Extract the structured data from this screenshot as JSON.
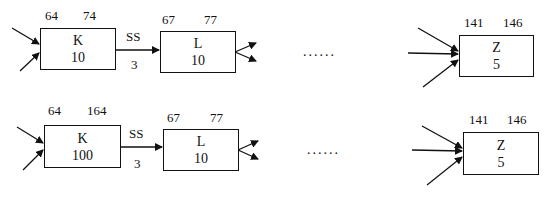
{
  "rows": [
    {
      "k": {
        "name": "K",
        "value": "10",
        "top_left": "64",
        "top_right": "74"
      },
      "edge": {
        "label_top": "SS",
        "label_bottom": "3"
      },
      "l": {
        "name": "L",
        "value": "10",
        "top_left": "67",
        "top_right": "77"
      },
      "ellipsis": "......",
      "z": {
        "name": "Z",
        "value": "5",
        "top_left": "141",
        "top_right": "146"
      }
    },
    {
      "k": {
        "name": "K",
        "value": "100",
        "top_left": "64",
        "top_right": "164"
      },
      "edge": {
        "label_top": "SS",
        "label_bottom": "3"
      },
      "l": {
        "name": "L",
        "value": "10",
        "top_left": "67",
        "top_right": "77"
      },
      "ellipsis": "......",
      "z": {
        "name": "Z",
        "value": "5",
        "top_left": "141",
        "top_right": "146"
      }
    }
  ]
}
